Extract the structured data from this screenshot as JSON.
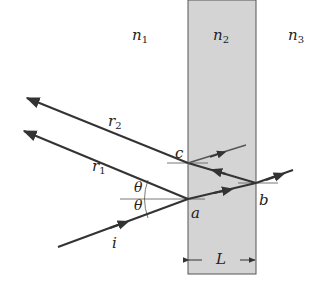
{
  "diagram": {
    "media": [
      {
        "id": "n1",
        "label": "n",
        "subscript": "1"
      },
      {
        "id": "n2",
        "label": "n",
        "subscript": "2"
      },
      {
        "id": "n3",
        "label": "n",
        "subscript": "3"
      }
    ],
    "rays": {
      "incident": "i",
      "r1": "r",
      "r1_sub": "1",
      "r2": "r",
      "r2_sub": "2"
    },
    "points": {
      "a": "a",
      "b": "b",
      "c": "c"
    },
    "angle": "θ",
    "thickness": "L",
    "colors": {
      "slab": "#d4d4d4",
      "line": "#333333"
    }
  }
}
